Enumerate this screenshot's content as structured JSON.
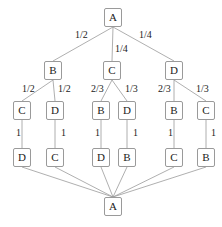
{
  "diagram": {
    "type": "probability-tree",
    "nodes": [
      {
        "id": "n0",
        "label": "A",
        "x": 104,
        "y": 8
      },
      {
        "id": "n1",
        "label": "B",
        "x": 44,
        "y": 61
      },
      {
        "id": "n2",
        "label": "C",
        "x": 103,
        "y": 61
      },
      {
        "id": "n3",
        "label": "D",
        "x": 165,
        "y": 61
      },
      {
        "id": "n4",
        "label": "C",
        "x": 13,
        "y": 101
      },
      {
        "id": "n5",
        "label": "D",
        "x": 46,
        "y": 101
      },
      {
        "id": "n6",
        "label": "B",
        "x": 92,
        "y": 101
      },
      {
        "id": "n7",
        "label": "D",
        "x": 118,
        "y": 101
      },
      {
        "id": "n8",
        "label": "B",
        "x": 165,
        "y": 101
      },
      {
        "id": "n9",
        "label": "C",
        "x": 197,
        "y": 101
      },
      {
        "id": "n10",
        "label": "D",
        "x": 13,
        "y": 148
      },
      {
        "id": "n11",
        "label": "C",
        "x": 46,
        "y": 148
      },
      {
        "id": "n12",
        "label": "D",
        "x": 92,
        "y": 148
      },
      {
        "id": "n13",
        "label": "B",
        "x": 118,
        "y": 148
      },
      {
        "id": "n14",
        "label": "C",
        "x": 165,
        "y": 148
      },
      {
        "id": "n15",
        "label": "B",
        "x": 197,
        "y": 148
      },
      {
        "id": "n16",
        "label": "A",
        "x": 104,
        "y": 197
      }
    ],
    "edge_labels": [
      {
        "text": "1/2",
        "x": 75,
        "y": 30
      },
      {
        "text": "1/4",
        "x": 115,
        "y": 44
      },
      {
        "text": "1/4",
        "x": 139,
        "y": 30
      },
      {
        "text": "1/2",
        "x": 22,
        "y": 84
      },
      {
        "text": "1/2",
        "x": 58,
        "y": 84
      },
      {
        "text": "2/3",
        "x": 91,
        "y": 84
      },
      {
        "text": "1/3",
        "x": 125,
        "y": 84
      },
      {
        "text": "2/3",
        "x": 158,
        "y": 84
      },
      {
        "text": "1/3",
        "x": 196,
        "y": 84
      },
      {
        "text": "1",
        "x": 16,
        "y": 128
      },
      {
        "text": "1",
        "x": 61,
        "y": 128
      },
      {
        "text": "1",
        "x": 95,
        "y": 128
      },
      {
        "text": "1",
        "x": 133,
        "y": 128
      },
      {
        "text": "1",
        "x": 168,
        "y": 128
      },
      {
        "text": "1",
        "x": 211,
        "y": 128
      }
    ]
  }
}
